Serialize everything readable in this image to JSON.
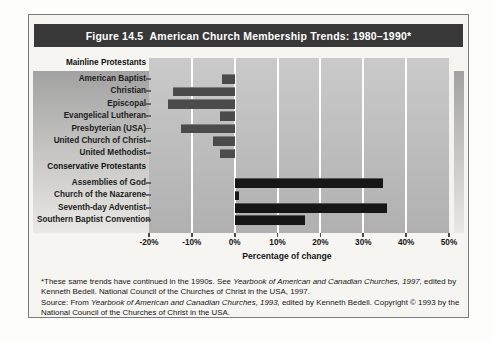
{
  "colors": {
    "title_bar_bg": "#383838",
    "bar_negative": "#4b4b4b",
    "bar_positive": "#161616",
    "gridline": "#ffffff"
  },
  "chart_data": {
    "type": "bar",
    "orientation": "horizontal",
    "title": "Figure 14.5  American Church Membership Trends: 1980–1990*",
    "xlabel": "Percentage of change",
    "xlim": [
      -20,
      50
    ],
    "xticks": [
      "-20%",
      "-10%",
      "0%",
      "10%",
      "20%",
      "30%",
      "40%",
      "50%"
    ],
    "grid": "vertical-white-lines",
    "legend": "none",
    "groups": [
      {
        "header": "Mainline Protestants",
        "items": [
          {
            "label": "American Baptist",
            "value": -3
          },
          {
            "label": "Christian",
            "value": -14.5
          },
          {
            "label": "Episcopal",
            "value": -15.5
          },
          {
            "label": "Evangelical Lutheran",
            "value": -3.5
          },
          {
            "label": "Presbyterian (USA)",
            "value": -12.5
          },
          {
            "label": "United Church of Christ",
            "value": -5
          },
          {
            "label": "United Methodist",
            "value": -3.5
          }
        ]
      },
      {
        "header": "Conservative Protestants",
        "items": [
          {
            "label": "Assemblies of God",
            "value": 34.5
          },
          {
            "label": "Church of the Nazarene",
            "value": 1
          },
          {
            "label": "Seventh-day Adventist",
            "value": 35.5
          },
          {
            "label": "Southern Baptist Convention",
            "value": 16.5
          }
        ]
      }
    ]
  },
  "footnote": {
    "paragraphs": [
      [
        {
          "text": "*These same trends have continued in the 1990s. See ",
          "italic": false
        },
        {
          "text": "Yearbook of American and Canadian Churches, 1997,",
          "italic": true
        },
        {
          "text": " edited by Kenneth Bedell. National Council of the Churches of Christ in the USA, 1997.",
          "italic": false
        }
      ],
      [
        {
          "text": "Source: From ",
          "italic": false
        },
        {
          "text": "Yearbook of American and Canadian Churches, 1993,",
          "italic": true
        },
        {
          "text": " edited by Kenneth Bedell. Copyright © 1993 by the National Council of the Churches of Christ in the USA.",
          "italic": false
        }
      ]
    ]
  }
}
